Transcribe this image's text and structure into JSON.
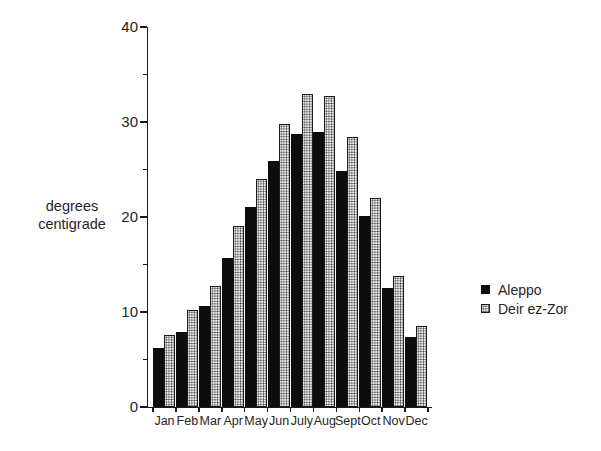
{
  "figure": {
    "background": "#ffffff",
    "text_color": "#262626",
    "y_axis_label_line1": "degrees",
    "y_axis_label_line2": "centigrade"
  },
  "chart_data": {
    "type": "bar",
    "title": "",
    "xlabel": "",
    "ylabel": "degrees centigrade",
    "ylim": [
      0,
      40
    ],
    "y_major_ticks": [
      0,
      10,
      20,
      30,
      40
    ],
    "y_minor_ticks": [
      5,
      15,
      25,
      35
    ],
    "grid": false,
    "legend_position": "right",
    "categories": [
      "Jan",
      "Feb",
      "Mar",
      "Apr",
      "May",
      "Jun",
      "July",
      "Aug",
      "Sept",
      "Oct",
      "Nov",
      "Dec"
    ],
    "series": [
      {
        "name": "Aleppo",
        "style": "solid",
        "color": "#0d0d0d",
        "values": [
          6.2,
          7.9,
          10.6,
          15.7,
          21.1,
          25.9,
          28.7,
          29.0,
          24.8,
          20.1,
          12.5,
          7.4
        ]
      },
      {
        "name": "Deir ez-Zor",
        "style": "stippled",
        "color": "#efefef",
        "values": [
          7.6,
          10.2,
          12.7,
          19.1,
          24.0,
          29.8,
          32.9,
          32.7,
          28.4,
          22.0,
          13.8,
          8.5
        ]
      }
    ]
  },
  "legend": {
    "items": [
      {
        "label": "Aleppo",
        "swatch": "solid-black-square"
      },
      {
        "label": "Deir ez-Zor",
        "swatch": "stippled-square"
      }
    ]
  }
}
